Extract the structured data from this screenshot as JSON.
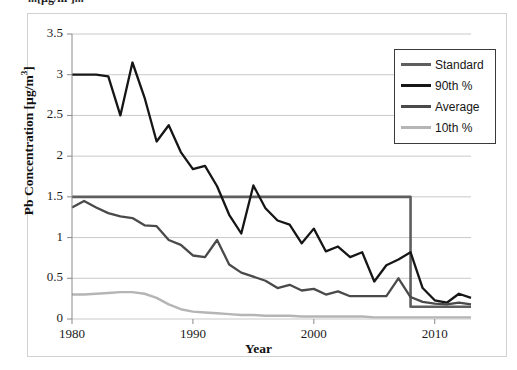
{
  "figure": {
    "clipped_caption": "...[µg/m³]...",
    "background": "#ffffff",
    "frame_color": "#d2d2d2"
  },
  "axes": {
    "y_label_html": "Pb Concentration [&micro;g/m<sup>3</sup>]",
    "y_label_text": "Pb Concentration [µg/m3]",
    "x_label": "Year",
    "y_ticks": [
      "0",
      "0.5",
      "1",
      "1.5",
      "2",
      "2.5",
      "3",
      "3.5"
    ],
    "x_ticks": [
      "1980",
      "1990",
      "2000",
      "2010"
    ],
    "ylim": [
      0,
      3.5
    ],
    "xlim": [
      1980,
      2013
    ],
    "grid": "horizontal"
  },
  "legend": {
    "position": "top-right",
    "items": [
      {
        "label": "Standard",
        "color": "#5e5e5e",
        "width": 3
      },
      {
        "label": "90th %",
        "color": "#161616",
        "width": 3.2
      },
      {
        "label": "Average",
        "color": "#4a4a4a",
        "width": 3
      },
      {
        "label": "10th %",
        "color": "#b5b5b5",
        "width": 3
      }
    ]
  },
  "chart_data": {
    "type": "line",
    "title": "",
    "xlabel": "Year",
    "ylabel": "Pb Concentration [µg/m3]",
    "xlim": [
      1980,
      2013
    ],
    "ylim": [
      0,
      3.5
    ],
    "grid": true,
    "legend_position": "top-right",
    "x": [
      1980,
      1981,
      1982,
      1983,
      1984,
      1985,
      1986,
      1987,
      1988,
      1989,
      1990,
      1991,
      1992,
      1993,
      1994,
      1995,
      1996,
      1997,
      1998,
      1999,
      2000,
      2001,
      2002,
      2003,
      2004,
      2005,
      2006,
      2007,
      2008,
      2009,
      2010,
      2011,
      2012,
      2013
    ],
    "series": [
      {
        "name": "Standard",
        "color": "#5e5e5e",
        "width": 2.6,
        "note": "Regulatory limit, steps from 1.5 to 0.15 in 2008",
        "values": [
          1.5,
          1.5,
          1.5,
          1.5,
          1.5,
          1.5,
          1.5,
          1.5,
          1.5,
          1.5,
          1.5,
          1.5,
          1.5,
          1.5,
          1.5,
          1.5,
          1.5,
          1.5,
          1.5,
          1.5,
          1.5,
          1.5,
          1.5,
          1.5,
          1.5,
          1.5,
          1.5,
          1.5,
          0.15,
          0.15,
          0.15,
          0.15,
          0.15,
          0.15
        ]
      },
      {
        "name": "90th %",
        "color": "#161616",
        "width": 2.3,
        "values": [
          3.0,
          3.0,
          3.0,
          2.98,
          2.5,
          3.15,
          2.72,
          2.18,
          2.38,
          2.05,
          1.84,
          1.88,
          1.63,
          1.28,
          1.05,
          1.64,
          1.36,
          1.21,
          1.16,
          0.93,
          1.11,
          0.83,
          0.89,
          0.76,
          0.82,
          0.46,
          0.66,
          0.73,
          0.82,
          0.38,
          0.23,
          0.2,
          0.31,
          0.26
        ]
      },
      {
        "name": "Average",
        "color": "#4a4a4a",
        "width": 2.3,
        "values": [
          1.37,
          1.45,
          1.37,
          1.3,
          1.26,
          1.24,
          1.15,
          1.14,
          0.97,
          0.91,
          0.78,
          0.76,
          0.97,
          0.67,
          0.57,
          0.52,
          0.47,
          0.38,
          0.42,
          0.35,
          0.37,
          0.3,
          0.34,
          0.28,
          0.28,
          0.28,
          0.28,
          0.5,
          0.27,
          0.21,
          0.19,
          0.18,
          0.2,
          0.18
        ]
      },
      {
        "name": "10th %",
        "color": "#b5b5b5",
        "width": 2.4,
        "values": [
          0.3,
          0.3,
          0.31,
          0.32,
          0.33,
          0.33,
          0.31,
          0.26,
          0.18,
          0.12,
          0.09,
          0.08,
          0.07,
          0.06,
          0.05,
          0.05,
          0.04,
          0.04,
          0.04,
          0.03,
          0.03,
          0.03,
          0.03,
          0.03,
          0.03,
          0.02,
          0.02,
          0.02,
          0.02,
          0.02,
          0.02,
          0.02,
          0.02,
          0.02
        ]
      }
    ]
  }
}
